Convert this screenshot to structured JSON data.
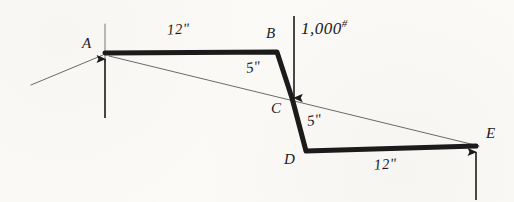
{
  "figure": {
    "kind": "free-body-diagram",
    "background_color": "#fbfaf7",
    "ink_color": "#1b1b1b",
    "thin_line_color": "#4a4a4a",
    "width": 514,
    "height": 202
  },
  "nodes": [
    {
      "id": "A",
      "label": "A",
      "x": 105,
      "y": 53,
      "label_x": 82,
      "label_y": 36
    },
    {
      "id": "B",
      "label": "B",
      "x": 277,
      "y": 52,
      "label_x": 266,
      "label_y": 26
    },
    {
      "id": "C",
      "label": "C",
      "x": 292,
      "y": 98,
      "label_x": 271,
      "label_y": 101
    },
    {
      "id": "D",
      "label": "D",
      "x": 306,
      "y": 151,
      "label_x": 284,
      "label_y": 152
    },
    {
      "id": "E",
      "label": "E",
      "x": 476,
      "y": 146,
      "label_x": 486,
      "label_y": 126
    }
  ],
  "members": {
    "stroke_width": 5,
    "path": "M 105 53 L 277 52 L 292 98 L 306 151 L 476 146"
  },
  "dimensions": [
    {
      "id": "top-span",
      "text": "12\"",
      "x": 167,
      "y": 22,
      "rotation": -4
    },
    {
      "id": "upper-web",
      "text": "5\"",
      "x": 246,
      "y": 60,
      "rotation": -8
    },
    {
      "id": "lower-web",
      "text": "5\"",
      "x": 307,
      "y": 113,
      "rotation": -8
    },
    {
      "id": "bottom-span",
      "text": "12\"",
      "x": 374,
      "y": 157,
      "rotation": -4
    }
  ],
  "load": {
    "id": "applied-load",
    "value": "1,000",
    "unit": "#",
    "label_x": 301,
    "label_y": 18,
    "arrow": {
      "x": 294,
      "y_start": 16,
      "y_end": 100
    },
    "direction": "down"
  },
  "reactions": [
    {
      "id": "reaction-a",
      "at_node": "A",
      "direction": "up",
      "arrow": {
        "x": 105,
        "y_start": 118,
        "y_end": 57
      }
    },
    {
      "id": "reaction-e",
      "at_node": "E",
      "direction": "up",
      "arrow": {
        "x": 476,
        "y_start": 200,
        "y_end": 150
      }
    }
  ],
  "construction_lines": [
    {
      "id": "line-a-e",
      "x1": 109,
      "y1": 56,
      "x2": 479,
      "y2": 146
    },
    {
      "id": "line-a-lower-left",
      "x1": 103,
      "y1": 55,
      "x2": 31,
      "y2": 85
    },
    {
      "id": "line-a-vertical",
      "x1": 105,
      "y1": 24,
      "x2": 105,
      "y2": 62
    }
  ]
}
